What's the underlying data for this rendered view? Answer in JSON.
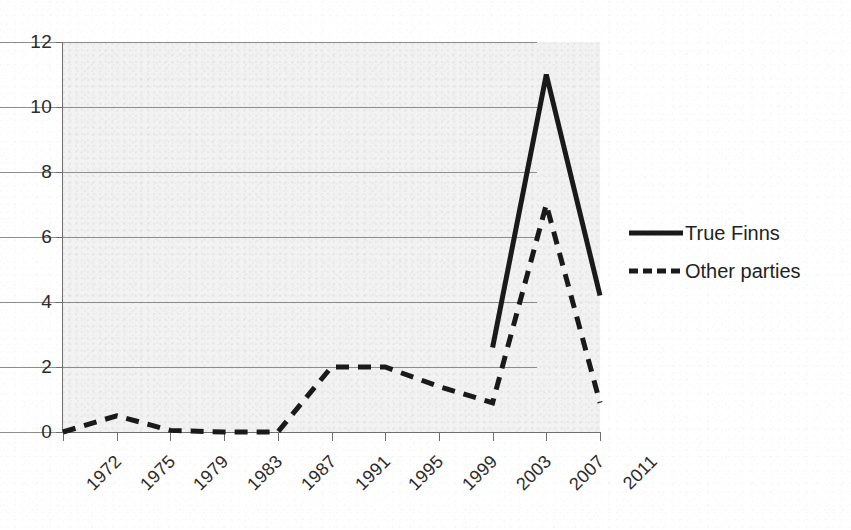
{
  "chart_data": {
    "type": "line",
    "title": "",
    "subtitle": "",
    "xlabel": "",
    "ylabel": "",
    "xlim": [
      1972,
      2011
    ],
    "ylim": [
      0,
      12
    ],
    "ytick_step": 2,
    "grid": true,
    "legend_position": "right",
    "categories": [
      "1972",
      "1975",
      "1979",
      "1983",
      "1987",
      "1991",
      "1995",
      "1999",
      "2003",
      "2007",
      "2011"
    ],
    "yticks": [
      "0",
      "2",
      "4",
      "6",
      "8",
      "10",
      "12"
    ],
    "series": [
      {
        "name": "True Finns",
        "style": "solid",
        "color": "#1a1a1a",
        "values": [
          null,
          null,
          null,
          null,
          null,
          null,
          null,
          null,
          2.6,
          11.0,
          4.2
        ]
      },
      {
        "name": "Other parties",
        "style": "dashed",
        "color": "#1a1a1a",
        "values": [
          0.0,
          0.5,
          0.05,
          0.0,
          0.0,
          2.0,
          2.0,
          1.4,
          0.9,
          7.0,
          0.9
        ]
      }
    ]
  },
  "legend": {
    "items": [
      {
        "label": "True Finns",
        "style": "solid",
        "swatch_name": "solid-line-swatch"
      },
      {
        "label": "Other parties",
        "style": "dashed",
        "swatch_name": "dashed-line-swatch"
      }
    ]
  },
  "axes": {
    "y": {
      "labels": [
        "12",
        "10",
        "8",
        "6",
        "4",
        "2",
        "0"
      ]
    },
    "x": {
      "labels": [
        "1972",
        "1975",
        "1979",
        "1983",
        "1987",
        "1991",
        "1995",
        "1999",
        "2003",
        "2007",
        "2011"
      ]
    }
  },
  "colors": {
    "ink": "#1a1a1a",
    "gridline": "#8d8d8d",
    "axis": "#6f6f6f",
    "plot_background": "#f2f2f2",
    "page_background": "#ffffff"
  }
}
